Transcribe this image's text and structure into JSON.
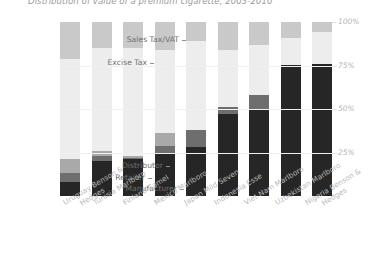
{
  "title": "Distribution of value of a premium cigarette, 2003-2010",
  "legend_labels": {
    "sales_tax": "Sales Tax/VAT",
    "excise_tax": "Excise Tax",
    "distributor": "Distributor",
    "retailer": "Retailer",
    "manufacturer": "Manufacturer"
  },
  "y_ticks": [
    "100%",
    "75%",
    "50%",
    "25%"
  ],
  "colors": {
    "sales_tax": "#c9c9c9",
    "excise_tax": "#ededed",
    "distributor": "#a9a9a9",
    "retailer": "#6e6e6e",
    "manufacturer": "#262626",
    "gridline": "#f0f0f0",
    "title_text": "#9a9a9a",
    "axis_text": "#b5b5b5",
    "category_text": "#6f6f6f"
  },
  "chart_data": {
    "type": "bar",
    "subtype": "stacked-100-percent",
    "title": "Distribution of value of a premium cigarette, 2003-2010",
    "xlabel": "",
    "ylabel": "",
    "ylim": [
      0,
      100
    ],
    "yticks": [
      25,
      50,
      75,
      100
    ],
    "grid": true,
    "legend": "left-axis-annotations",
    "categories": [
      "Uruguay Benson & Hedges",
      "Tunisia Marlboro",
      "Finland Camel",
      "Mexico Marlboro",
      "Japan Mild Seven",
      "Indonesia Esse",
      "Viet Nam Marlboro",
      "Uzbekistan Marlboro",
      "Nigeria Benson & Hedges"
    ],
    "category_lines": [
      [
        "Uruguay Benson &",
        "Hedges"
      ],
      [
        "Tunisia Marlboro"
      ],
      [
        "Finland Camel"
      ],
      [
        "Mexico Marlboro"
      ],
      [
        "Japan Mild Seven"
      ],
      [
        "Indonesia Esse"
      ],
      [
        "Viet Nam Marlboro"
      ],
      [
        "Uzbekistan Marlboro"
      ],
      [
        "Nigeria Benson &",
        "Hedges"
      ]
    ],
    "series": [
      {
        "name": "Manufacturer",
        "values": [
          8,
          20,
          21,
          24,
          28,
          47,
          50,
          75,
          76
        ]
      },
      {
        "name": "Retailer",
        "values": [
          5,
          3,
          1,
          5,
          10,
          4,
          8,
          0,
          0
        ]
      },
      {
        "name": "Distributor",
        "values": [
          8,
          3,
          1,
          7,
          0,
          0,
          0,
          0,
          0
        ]
      },
      {
        "name": "Excise Tax",
        "values": [
          58,
          59,
          62,
          48,
          51,
          33,
          29,
          16,
          18
        ]
      },
      {
        "name": "Sales Tax/VAT",
        "values": [
          21,
          15,
          15,
          16,
          11,
          16,
          13,
          9,
          6
        ]
      }
    ]
  }
}
